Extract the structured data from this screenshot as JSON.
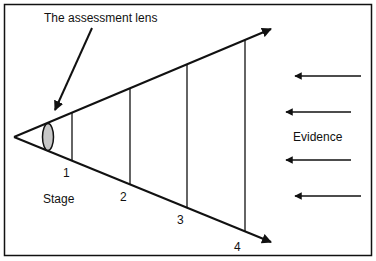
{
  "diagram": {
    "title_label": "The assessment lens",
    "stage_label": "Stage",
    "stages": [
      "1",
      "2",
      "3",
      "4"
    ],
    "evidence_label": "Evidence",
    "colors": {
      "stroke": "#111111",
      "lens_fill": "#c8c8c8",
      "background": "#ffffff"
    }
  }
}
